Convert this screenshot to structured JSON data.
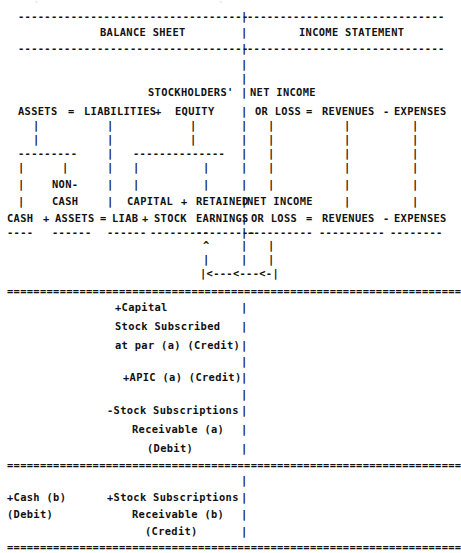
{
  "document": {
    "title": "Accounting Equation / Stock Subscription ASCII Diagram",
    "char_width_px": 6.4,
    "line_height_px": 14.1,
    "text_color": "#111111",
    "background_color": "#ffffff"
  },
  "headers": {
    "balance_sheet": "BALANCE SHEET",
    "income_statement": "INCOME STATEMENT"
  },
  "equation": {
    "assets": "ASSETS",
    "equals": "=",
    "liabilities": "LIABILITIES",
    "plus": "+",
    "stockholders": "STOCKHOLDERS'",
    "equity": "EQUITY",
    "net_income": "NET INCOME",
    "or_loss": "OR LOSS",
    "revenues": "REVENUES",
    "minus": "-",
    "expenses": "EXPENSES"
  },
  "detail": {
    "cash": "CASH",
    "non": "NON-",
    "non_cash": "CASH",
    "assets": "ASSETS",
    "liab": "LIAB",
    "capital": "CAPITAL",
    "stock": "STOCK",
    "retained": "RETAINED",
    "earnings": "EARNINGS"
  },
  "entries_a": [
    "+Capital",
    "Stock Subscribed",
    "at par (a) (Credit)",
    "+APIC (a) (Credit)",
    "-Stock Subscriptions",
    "Receivable (a)",
    "(Debit)"
  ],
  "entries_b": {
    "left": [
      "+Cash (b)",
      "(Debit)"
    ],
    "right": [
      "+Stock Subscriptions",
      "Receivable (b)",
      "(Credit)"
    ]
  },
  "ascii_rows": [
    {
      "y": 2,
      "x": 18,
      "text": "·· ·    ·   · ·    ··   ·· ·      ·· ·  ·     ··· ·· ·   ··",
      "ghost": true
    },
    {
      "y": 15,
      "x": 18,
      "text": "-----------------------------------|------------------------------------"
    },
    {
      "y": 29,
      "x": 100,
      "text": "BALANCE SHEET              |              INCOME STATEMENT"
    },
    {
      "y": 43,
      "x": 18,
      "text": "-----------------------------------|------------------------------------"
    },
    {
      "y": 57,
      "x": 243,
      "text": "|"
    },
    {
      "y": 71,
      "x": 243,
      "text": "|"
    },
    {
      "y": 85,
      "x": 148,
      "text": "STOCKHOLDERS'    |"
    },
    {
      "y": 99,
      "x": 18,
      "text": "ASSETS  =  LIABILITIES +   EQUITY    |  NET INCOME"
    },
    {
      "y": 113,
      "x": 18,
      "text": "ASSETS  =  LIABILITIES +   EQUITY    |  OR LOSS  =  REVENUES - EXPENSES"
    },
    {
      "y": 127,
      "x": 18,
      "text": "|          |            |       |  |       |       |"
    },
    {
      "y": 141,
      "x": 18,
      "text": "|          |            |       |  |       |       |"
    },
    {
      "y": 155,
      "x": 18,
      "text": "---------  |      -------------- |  |       |       |"
    },
    {
      "y": 169,
      "x": 18,
      "text": "|     |    |      |       |      |  |       |       |"
    },
    {
      "y": 183,
      "x": 18,
      "text": "|   NON-   |      |       |      |  |       |       |"
    },
    {
      "y": 197,
      "x": 18,
      "text": "|   CASH   |   CAPITAL + RETAINED|NET INCOME"
    },
    {
      "y": 211,
      "x": 18,
      "text": "CASH + ASSETS = LIAB + STOCK  EARNINGS | OR LOSS  =  REVENUES - EXPENSES"
    },
    {
      "y": 225,
      "x": 18,
      "text": "----  ------ ------ ---------  ---------|----------  ----------  --------"
    },
    {
      "y": 239,
      "x": 200,
      "text": "^      |    |"
    },
    {
      "y": 253,
      "x": 200,
      "text": "|      |    |"
    },
    {
      "y": 267,
      "x": 197,
      "text": "|<---<---<-|"
    },
    {
      "y": 288,
      "x": 7,
      "text": "====================================================================="
    },
    {
      "y": 303,
      "x": 110,
      "text": "+Capital             |"
    },
    {
      "y": 322,
      "x": 110,
      "text": "Stock Subscribed     |"
    },
    {
      "y": 341,
      "x": 110,
      "text": "at par (a) (Credit)  |"
    },
    {
      "y": 360,
      "x": 110,
      "text": "+APIC (a) (Credit)   |"
    },
    {
      "y": 382,
      "x": 110,
      "text": "-Stock Subscriptions |"
    },
    {
      "y": 401,
      "x": 110,
      "text": "Receivable (a)       |"
    },
    {
      "y": 420,
      "x": 110,
      "text": "(Debit)              |"
    },
    {
      "y": 441,
      "x": 7,
      "text": "====================================================================="
    },
    {
      "y": 463,
      "x": 7,
      "text": "+Cash (b)     +Stock Subscriptions |"
    },
    {
      "y": 482,
      "x": 7,
      "text": "(Debit)         Receivable (b)     |"
    },
    {
      "y": 501,
      "x": 7,
      "text": "                  (Credit)         |"
    },
    {
      "y": 518,
      "x": 7,
      "text": "====================================================================="
    }
  ],
  "lines": {
    "dash_char": "-",
    "double_char": "=",
    "pipe_char": "|",
    "arrow_char": "<",
    "caret_char": "^"
  }
}
